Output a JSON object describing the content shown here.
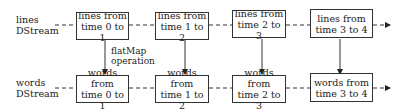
{
  "rows": [
    {
      "label_line1": "lines",
      "label_line2": "DStream",
      "boxes": [
        {
          "line1": "lines from",
          "line2": "time 0 to 1"
        },
        {
          "line1": "lines from",
          "line2": "time 1 to 2"
        },
        {
          "line1": "lines from",
          "line2": "time 2 to 3"
        },
        {
          "line1": "lines from",
          "line2": "time 3 to 4"
        }
      ]
    },
    {
      "label_line1": "words",
      "label_line2": "DStream",
      "boxes": [
        {
          "line1": "words from",
          "line2": "time 0 to 1"
        },
        {
          "line1": "words from",
          "line2": "time 1 to 2"
        },
        {
          "line1": "words from",
          "line2": "time 2 to 3"
        },
        {
          "line1": "words from",
          "line2": "time 3 to 4"
        }
      ]
    }
  ],
  "operation": {
    "line1": "flatMap",
    "line2": "operation"
  }
}
